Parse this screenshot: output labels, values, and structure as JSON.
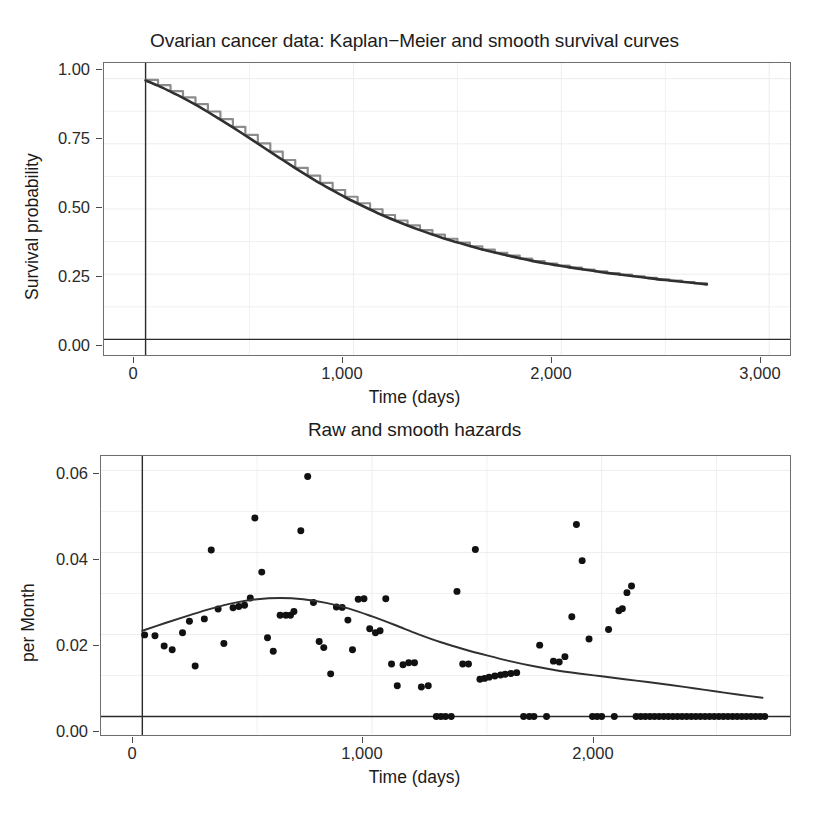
{
  "figure": {
    "background": "#ffffff",
    "axis_color": "#6e6e6e",
    "grid_color": "#ededed"
  },
  "survival": {
    "title": "Ovarian cancer data: Kaplan−Meier and smooth survival curves",
    "ylabel": "Survival probability",
    "xlabel": "Time (days)",
    "yticks": [
      "0.00",
      "0.25",
      "0.50",
      "0.75",
      "1.00"
    ],
    "xticks": [
      "0",
      "1,000",
      "2,000",
      "3,000"
    ]
  },
  "hazard": {
    "title": "Raw and smooth hazards",
    "ylabel": "per Month",
    "xlabel": "Time (days)",
    "yticks": [
      "0.00",
      "0.02",
      "0.04",
      "0.06"
    ],
    "xticks": [
      "0",
      "1,000",
      "2,000"
    ]
  },
  "chart_data": [
    {
      "type": "line",
      "title": "Ovarian cancer data: Kaplan−Meier and smooth survival curves",
      "xlabel": "Time (days)",
      "ylabel": "Survival probability",
      "xlim": [
        -200,
        3100
      ],
      "ylim": [
        -0.06,
        1.06
      ],
      "xticks": [
        0,
        1000,
        2000,
        3000
      ],
      "yticks": [
        0.0,
        0.25,
        0.5,
        0.75,
        1.0
      ],
      "grid": true,
      "legend": "none",
      "series": [
        {
          "name": "Kaplan-Meier step curve",
          "style": "step",
          "color": "#8c8c8c",
          "linewidth": 2.2,
          "x": [
            0,
            60,
            120,
            180,
            240,
            300,
            360,
            420,
            480,
            540,
            600,
            660,
            720,
            780,
            840,
            900,
            960,
            1020,
            1080,
            1140,
            1200,
            1260,
            1320,
            1380,
            1440,
            1500,
            1560,
            1620,
            1680,
            1740,
            1800,
            1860,
            1920,
            1980,
            2040,
            2100,
            2160,
            2220,
            2280,
            2340,
            2400,
            2460,
            2520,
            2580,
            2640,
            2700
          ],
          "y": [
            0.995,
            0.975,
            0.952,
            0.928,
            0.902,
            0.874,
            0.845,
            0.815,
            0.784,
            0.752,
            0.72,
            0.688,
            0.658,
            0.628,
            0.6,
            0.573,
            0.547,
            0.522,
            0.499,
            0.477,
            0.456,
            0.437,
            0.419,
            0.402,
            0.386,
            0.371,
            0.357,
            0.344,
            0.332,
            0.321,
            0.31,
            0.3,
            0.291,
            0.283,
            0.275,
            0.268,
            0.261,
            0.254,
            0.248,
            0.242,
            0.236,
            0.23,
            0.225,
            0.22,
            0.215,
            0.21
          ]
        },
        {
          "name": "Smooth survival curve",
          "style": "smooth",
          "color": "#303030",
          "linewidth": 2.6,
          "x": [
            0,
            60,
            120,
            180,
            240,
            300,
            360,
            420,
            480,
            540,
            600,
            660,
            720,
            780,
            840,
            900,
            960,
            1020,
            1080,
            1140,
            1200,
            1260,
            1320,
            1380,
            1440,
            1500,
            1560,
            1620,
            1680,
            1740,
            1800,
            1860,
            1920,
            1980,
            2040,
            2100,
            2160,
            2220,
            2280,
            2340,
            2400,
            2460,
            2520,
            2580,
            2640,
            2700
          ],
          "y": [
            0.993,
            0.973,
            0.95,
            0.926,
            0.9,
            0.872,
            0.843,
            0.813,
            0.782,
            0.751,
            0.719,
            0.688,
            0.657,
            0.627,
            0.598,
            0.571,
            0.545,
            0.521,
            0.498,
            0.476,
            0.456,
            0.437,
            0.419,
            0.402,
            0.386,
            0.372,
            0.358,
            0.345,
            0.333,
            0.322,
            0.311,
            0.301,
            0.292,
            0.284,
            0.276,
            0.269,
            0.262,
            0.255,
            0.249,
            0.243,
            0.237,
            0.231,
            0.226,
            0.221,
            0.216,
            0.211
          ]
        }
      ]
    },
    {
      "type": "scatter",
      "title": "Raw and smooth hazards",
      "xlabel": "Time (days)",
      "ylabel": "per Month",
      "xlim": [
        -180,
        2820
      ],
      "ylim": [
        -0.0045,
        0.0635
      ],
      "xticks": [
        0,
        1000,
        2000
      ],
      "yticks": [
        0.0,
        0.02,
        0.04,
        0.06
      ],
      "grid": true,
      "legend": "none",
      "series": [
        {
          "name": "Raw hazard",
          "style": "points",
          "color": "#111111",
          "markersize": 7,
          "points": [
            [
              10,
              0.0199
            ],
            [
              55,
              0.0197
            ],
            [
              95,
              0.0172
            ],
            [
              130,
              0.0163
            ],
            [
              175,
              0.0204
            ],
            [
              205,
              0.0232
            ],
            [
              230,
              0.0123
            ],
            [
              270,
              0.0238
            ],
            [
              300,
              0.0406
            ],
            [
              330,
              0.0262
            ],
            [
              355,
              0.0178
            ],
            [
              395,
              0.0265
            ],
            [
              420,
              0.0268
            ],
            [
              445,
              0.0271
            ],
            [
              470,
              0.0289
            ],
            [
              490,
              0.0484
            ],
            [
              520,
              0.0352
            ],
            [
              545,
              0.0192
            ],
            [
              570,
              0.0159
            ],
            [
              600,
              0.0247
            ],
            [
              625,
              0.0247
            ],
            [
              645,
              0.0247
            ],
            [
              660,
              0.0256
            ],
            [
              690,
              0.0453
            ],
            [
              720,
              0.0585
            ],
            [
              745,
              0.0278
            ],
            [
              770,
              0.0183
            ],
            [
              790,
              0.0168
            ],
            [
              820,
              0.0104
            ],
            [
              845,
              0.0267
            ],
            [
              870,
              0.0266
            ],
            [
              895,
              0.0235
            ],
            [
              915,
              0.0163
            ],
            [
              940,
              0.0286
            ],
            [
              965,
              0.0287
            ],
            [
              990,
              0.0214
            ],
            [
              1015,
              0.0204
            ],
            [
              1035,
              0.0209
            ],
            [
              1060,
              0.0287
            ],
            [
              1085,
              0.0128
            ],
            [
              1110,
              0.0075
            ],
            [
              1135,
              0.0126
            ],
            [
              1160,
              0.0131
            ],
            [
              1185,
              0.0131
            ],
            [
              1215,
              0.0072
            ],
            [
              1245,
              0.0075
            ],
            [
              1280,
              0.0,
              0
            ],
            [
              1300,
              0.0
            ],
            [
              1320,
              0.0
            ],
            [
              1345,
              0.0
            ],
            [
              1370,
              0.0305
            ],
            [
              1395,
              0.0128
            ],
            [
              1420,
              0.0128
            ],
            [
              1450,
              0.0407
            ],
            [
              1470,
              0.0091
            ],
            [
              1490,
              0.0093
            ],
            [
              1510,
              0.0096
            ],
            [
              1535,
              0.0099
            ],
            [
              1560,
              0.0101
            ],
            [
              1580,
              0.0103
            ],
            [
              1605,
              0.0105
            ],
            [
              1630,
              0.0107
            ],
            [
              1660,
              0.0
            ],
            [
              1685,
              0.0
            ],
            [
              1705,
              0.0
            ],
            [
              1730,
              0.0174
            ],
            [
              1760,
              0.0
            ],
            [
              1790,
              0.0135
            ],
            [
              1815,
              0.0133
            ],
            [
              1840,
              0.0146
            ],
            [
              1870,
              0.0243
            ],
            [
              1890,
              0.0468
            ],
            [
              1915,
              0.038
            ],
            [
              1945,
              0.0189
            ],
            [
              1960,
              0.0
            ],
            [
              1980,
              0.0
            ],
            [
              2000,
              0.0
            ],
            [
              2030,
              0.0212
            ],
            [
              2055,
              0.0
            ],
            [
              2075,
              0.0258
            ],
            [
              2090,
              0.0263
            ],
            [
              2110,
              0.0302
            ],
            [
              2130,
              0.0318
            ],
            [
              2150,
              0.0
            ],
            [
              2170,
              0.0
            ],
            [
              2190,
              0.0
            ],
            [
              2210,
              0.0
            ],
            [
              2230,
              0.0
            ],
            [
              2250,
              0.0
            ],
            [
              2270,
              0.0
            ],
            [
              2290,
              0.0
            ],
            [
              2310,
              0.0
            ],
            [
              2330,
              0.0
            ],
            [
              2350,
              0.0
            ],
            [
              2370,
              0.0
            ],
            [
              2390,
              0.0
            ],
            [
              2410,
              0.0
            ],
            [
              2430,
              0.0
            ],
            [
              2450,
              0.0
            ],
            [
              2470,
              0.0
            ],
            [
              2490,
              0.0
            ],
            [
              2510,
              0.0
            ],
            [
              2530,
              0.0
            ],
            [
              2550,
              0.0
            ],
            [
              2570,
              0.0
            ],
            [
              2590,
              0.0
            ],
            [
              2610,
              0.0
            ],
            [
              2630,
              0.0
            ],
            [
              2650,
              0.0
            ],
            [
              2670,
              0.0
            ],
            [
              2690,
              0.0
            ],
            [
              2710,
              0.0
            ]
          ]
        },
        {
          "name": "Smooth hazard",
          "style": "smooth",
          "color": "#303030",
          "linewidth": 2.0,
          "x": [
            0,
            100,
            200,
            300,
            400,
            500,
            600,
            700,
            800,
            900,
            1000,
            1100,
            1200,
            1300,
            1400,
            1500,
            1600,
            1700,
            1800,
            1900,
            2000,
            2100,
            2200,
            2300,
            2400,
            2500,
            2600,
            2700
          ],
          "y": [
            0.0209,
            0.0228,
            0.0246,
            0.0263,
            0.0277,
            0.0286,
            0.0289,
            0.0286,
            0.0277,
            0.0263,
            0.0244,
            0.0223,
            0.0201,
            0.0181,
            0.0164,
            0.0149,
            0.0135,
            0.0123,
            0.0113,
            0.0105,
            0.0098,
            0.0091,
            0.0084,
            0.0077,
            0.0069,
            0.0061,
            0.0053,
            0.0046
          ]
        }
      ]
    }
  ]
}
